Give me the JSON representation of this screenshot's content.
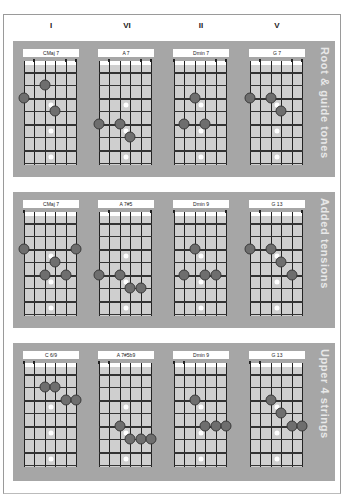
{
  "columns": [
    {
      "numeral": "I",
      "x": 51
    },
    {
      "numeral": "VI",
      "x": 127
    },
    {
      "numeral": "II",
      "x": 201
    },
    {
      "numeral": "V",
      "x": 277
    }
  ],
  "panels": [
    {
      "title": "Root & guide tones",
      "top": 41,
      "height": 136,
      "diagrams": [
        {
          "name": "CMaj 7",
          "ticks": [
            1,
            4,
            5
          ],
          "dots": [
            [
              2,
              2
            ],
            [
              0,
              3
            ],
            [
              3,
              4
            ]
          ]
        },
        {
          "name": "A 7",
          "ticks": [
            1,
            4,
            5
          ],
          "dots": [
            [
              0,
              5
            ],
            [
              2,
              5
            ],
            [
              3,
              6
            ]
          ]
        },
        {
          "name": "Dmin 7",
          "ticks": [
            0,
            4,
            5
          ],
          "dots": [
            [
              2,
              3
            ],
            [
              1,
              5
            ],
            [
              3,
              5
            ]
          ]
        },
        {
          "name": "G 7",
          "ticks": [
            1,
            4,
            5
          ],
          "dots": [
            [
              0,
              3
            ],
            [
              2,
              3
            ],
            [
              3,
              4
            ]
          ]
        }
      ]
    },
    {
      "title": "Added tensions",
      "top": 192,
      "height": 136,
      "diagrams": [
        {
          "name": "CMaj 7",
          "ticks": [
            0
          ],
          "dots": [
            [
              0,
              3
            ],
            [
              5,
              3
            ],
            [
              3,
              4
            ],
            [
              2,
              5
            ],
            [
              4,
              5
            ]
          ]
        },
        {
          "name": "A 7#5",
          "ticks": [
            1,
            5
          ],
          "dots": [
            [
              0,
              5
            ],
            [
              2,
              5
            ],
            [
              3,
              6
            ],
            [
              4,
              6
            ]
          ]
        },
        {
          "name": "Dmin 9",
          "ticks": [
            0,
            5
          ],
          "dots": [
            [
              2,
              3
            ],
            [
              1,
              5
            ],
            [
              3,
              5
            ],
            [
              4,
              5
            ]
          ]
        },
        {
          "name": "G 13",
          "ticks": [
            1,
            5
          ],
          "dots": [
            [
              0,
              3
            ],
            [
              2,
              3
            ],
            [
              3,
              4
            ],
            [
              4,
              5
            ]
          ]
        }
      ]
    },
    {
      "title": "Upper 4 strings",
      "top": 343,
      "height": 138,
      "diagrams": [
        {
          "name": "C 6/9",
          "ticks": [
            0,
            1
          ],
          "dots": [
            [
              2,
              2
            ],
            [
              3,
              2
            ],
            [
              4,
              3
            ],
            [
              5,
              3
            ]
          ]
        },
        {
          "name": "A 7#5b9",
          "ticks": [
            0,
            1
          ],
          "dots": [
            [
              2,
              5
            ],
            [
              3,
              6
            ],
            [
              4,
              6
            ],
            [
              5,
              6
            ]
          ]
        },
        {
          "name": "Dmin 9",
          "ticks": [
            0,
            1
          ],
          "dots": [
            [
              2,
              3
            ],
            [
              3,
              5
            ],
            [
              4,
              5
            ],
            [
              5,
              5
            ]
          ]
        },
        {
          "name": "G 13",
          "ticks": [
            0,
            1
          ],
          "dots": [
            [
              2,
              3
            ],
            [
              3,
              4
            ],
            [
              4,
              5
            ],
            [
              5,
              5
            ]
          ]
        }
      ]
    }
  ],
  "diagram_x": [
    23,
    98,
    173,
    249
  ],
  "markers": [
    [
      2.5,
      3
    ],
    [
      2.5,
      5
    ],
    [
      2.5,
      7
    ]
  ],
  "colors": {
    "panel": "#a6a6a6",
    "fretboard": "#cfcfcf",
    "dot": "#6e6e6e",
    "label_text": "#e8e8e8"
  }
}
